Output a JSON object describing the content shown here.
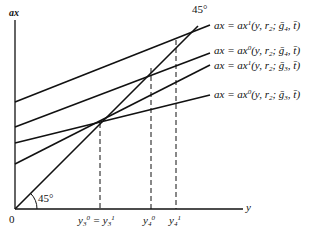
{
  "axes": {
    "y_axis_label": "ax",
    "x_axis_label": "y",
    "origin_label": "0"
  },
  "angle_labels": {
    "bottom": "45°",
    "top": "45°"
  },
  "curves": [
    {
      "label_prefix": "ax = ax",
      "sup": "1",
      "args": "(y, r",
      "r_sub": "2",
      "sep": "; ",
      "g": "ḡ",
      "g_sub": "4",
      "tail": ", t̄)"
    },
    {
      "label_prefix": "ax = ax",
      "sup": "0",
      "args": "(y, r",
      "r_sub": "2",
      "sep": "; ",
      "g": "ḡ",
      "g_sub": "4",
      "tail": ", t̄)"
    },
    {
      "label_prefix": "ax = ax",
      "sup": "1",
      "args": "(y, r",
      "r_sub": "2",
      "sep": "; ",
      "g": "ḡ",
      "g_sub": "3",
      "tail": ", t̄)"
    },
    {
      "label_prefix": "ax = ax",
      "sup": "0",
      "args": "(y, r",
      "r_sub": "2",
      "sep": "; ",
      "g": "ḡ",
      "g_sub": "3",
      "tail": ", t̄)"
    }
  ],
  "x_ticks": {
    "y3": {
      "base": "y",
      "sub": "3",
      "sup0": "0",
      "eq": " = ",
      "sup1": "1"
    },
    "y4_0": {
      "base": "y",
      "sub": "4",
      "sup": "0"
    },
    "y4_1": {
      "base": "y",
      "sub": "4",
      "sup": "1"
    }
  }
}
